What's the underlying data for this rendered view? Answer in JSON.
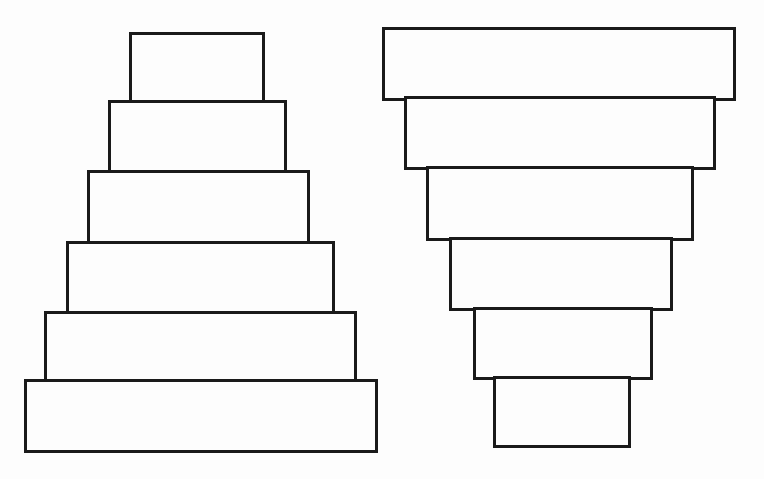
{
  "diagram": {
    "type": "stacked-rectangles",
    "stroke_color": "#1a1a1a",
    "fill_color": "#fdfdfd",
    "left_stack": {
      "description": "pyramid - narrow on top, wide at bottom",
      "blocks": [
        {
          "x": 129,
          "y": 32,
          "w": 136,
          "h": 73
        },
        {
          "x": 108,
          "y": 100,
          "w": 179,
          "h": 74
        },
        {
          "x": 87,
          "y": 170,
          "w": 223,
          "h": 75
        },
        {
          "x": 66,
          "y": 241,
          "w": 269,
          "h": 74
        },
        {
          "x": 44,
          "y": 311,
          "w": 313,
          "h": 73
        },
        {
          "x": 24,
          "y": 379,
          "w": 354,
          "h": 74
        }
      ]
    },
    "right_stack": {
      "description": "inverted pyramid - wide on top, narrow at bottom",
      "blocks": [
        {
          "x": 382,
          "y": 27,
          "w": 354,
          "h": 74
        },
        {
          "x": 404,
          "y": 96,
          "w": 312,
          "h": 74
        },
        {
          "x": 426,
          "y": 166,
          "w": 268,
          "h": 75
        },
        {
          "x": 449,
          "y": 237,
          "w": 224,
          "h": 74
        },
        {
          "x": 473,
          "y": 307,
          "w": 180,
          "h": 73
        },
        {
          "x": 493,
          "y": 376,
          "w": 138,
          "h": 72
        }
      ]
    }
  }
}
